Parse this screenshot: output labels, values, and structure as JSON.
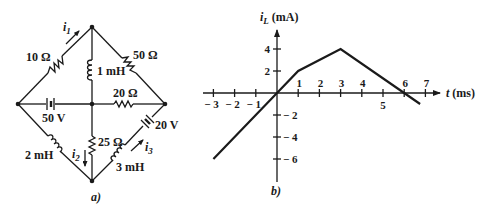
{
  "circuit": {
    "caption": "a)",
    "nodes": {
      "top": [
        92,
        27
      ],
      "left": [
        18,
        104
      ],
      "middle": [
        92,
        104
      ],
      "right": [
        165,
        104
      ],
      "bottom": [
        92,
        181
      ]
    },
    "components": [
      {
        "id": "r10",
        "type": "resistor",
        "label": "10 Ω",
        "branch": "left-top"
      },
      {
        "id": "r50",
        "type": "resistor",
        "label": "50 Ω",
        "branch": "top-right"
      },
      {
        "id": "l1",
        "type": "inductor",
        "label": "1 mH",
        "branch": "top-middle"
      },
      {
        "id": "v50",
        "type": "battery",
        "label": "50 V",
        "branch": "left-middle"
      },
      {
        "id": "r20",
        "type": "resistor",
        "label": "20 Ω",
        "branch": "middle-right"
      },
      {
        "id": "v20",
        "type": "battery",
        "label": "20 V",
        "branch": "right-bottom"
      },
      {
        "id": "l3",
        "type": "inductor",
        "label": "3 mH",
        "branch": "right-bottom"
      },
      {
        "id": "r25",
        "type": "resistor",
        "label": "25 Ω",
        "branch": "middle-bottom"
      },
      {
        "id": "l2",
        "type": "inductor",
        "label": "2 mH",
        "branch": "left-bottom"
      }
    ],
    "currents": [
      {
        "label": "i",
        "subscript": "1",
        "branch": "left-top",
        "direction": "toward top"
      },
      {
        "label": "i",
        "subscript": "2",
        "branch": "middle-bottom",
        "direction": "down"
      },
      {
        "label": "i",
        "subscript": "3",
        "branch": "bottom-right",
        "direction": "toward right node"
      }
    ]
  },
  "chart_data": {
    "type": "line",
    "caption": "b)",
    "title": "",
    "ylabel": "i_L (mA)",
    "ylabel_parts": {
      "symbol": "i",
      "subscript": "L",
      "unit": "(mA)"
    },
    "xlabel": "t (ms)",
    "xlabel_parts": {
      "symbol": "t",
      "unit": "(ms)"
    },
    "x_ticks": [
      -3,
      -2,
      -1,
      1,
      2,
      3,
      4,
      5,
      6,
      7
    ],
    "x_tick_labels": [
      "− 3",
      "− 2",
      "− 1",
      "1",
      "2",
      "3",
      "4",
      "5",
      "6",
      "7"
    ],
    "y_ticks": [
      4,
      2,
      -2,
      -4,
      -6
    ],
    "y_tick_labels": [
      "4",
      "2",
      "− 2",
      "− 4",
      "− 6"
    ],
    "xlim": [
      -3.4,
      7.8
    ],
    "ylim": [
      -8,
      6
    ],
    "grid": false,
    "legend": null,
    "series": [
      {
        "name": "i_L(t)",
        "x": [
          -3,
          0,
          1,
          3,
          6,
          6.75
        ],
        "y": [
          -6,
          0,
          2,
          4,
          0,
          -1
        ]
      }
    ]
  }
}
